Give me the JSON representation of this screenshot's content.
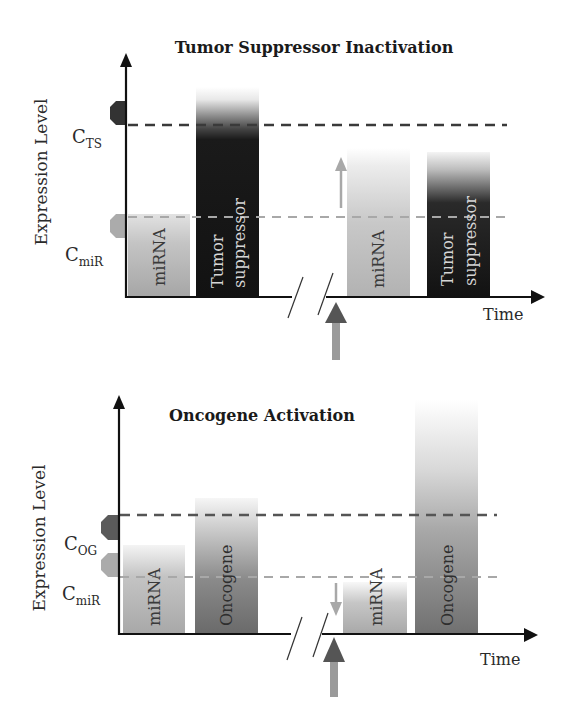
{
  "figure": {
    "panels": [
      {
        "id": "tumor-suppressor-inactivation",
        "title": "Tumor Suppressor Inactivation",
        "y_axis_label": "Expression Level",
        "x_axis_label": "Time",
        "thresholds": [
          {
            "symbol": "C",
            "subscript": "TS",
            "style": "dark-dashed"
          },
          {
            "symbol": "C",
            "subscript": "miR",
            "style": "light-dashed"
          }
        ],
        "before": {
          "bars": [
            {
              "label": "miRNA",
              "level": "at C_miR",
              "shade": "light-grey"
            },
            {
              "label_lines": [
                "Tumor",
                "suppressor"
              ],
              "level": "above C_TS",
              "shade": "black"
            }
          ]
        },
        "after": {
          "change_arrow": "up",
          "bars": [
            {
              "label": "miRNA",
              "level": "well above C_miR",
              "shade": "light-grey"
            },
            {
              "label_lines": [
                "Tumor",
                "suppressor"
              ],
              "level": "below C_TS",
              "shade": "black"
            }
          ]
        }
      },
      {
        "id": "oncogene-activation",
        "title": "Oncogene Activation",
        "y_axis_label": "Expression Level",
        "x_axis_label": "Time",
        "thresholds": [
          {
            "symbol": "C",
            "subscript": "OG",
            "style": "dark-dashed"
          },
          {
            "symbol": "C",
            "subscript": "miR",
            "style": "light-dashed"
          }
        ],
        "before": {
          "bars": [
            {
              "label": "miRNA",
              "level": "at C_miR",
              "shade": "light-grey"
            },
            {
              "label": "Oncogene",
              "level": "at C_OG",
              "shade": "mid-grey"
            }
          ]
        },
        "after": {
          "change_arrow": "down",
          "bars": [
            {
              "label": "miRNA",
              "level": "below C_miR",
              "shade": "light-grey"
            },
            {
              "label": "Oncogene",
              "level": "well above C_OG",
              "shade": "mid-grey"
            }
          ]
        }
      }
    ],
    "colors": {
      "axis": "#111111",
      "dark_threshold": "#3a3a3a",
      "light_threshold": "#a8a8a8",
      "tumor_suppressor_bar": "#141414",
      "oncogene_bar": "#6e6e6e",
      "mirna_bar": "#acacac",
      "event_arrow_head": "#555555",
      "event_arrow_shaft": "#9a9a9a"
    }
  }
}
